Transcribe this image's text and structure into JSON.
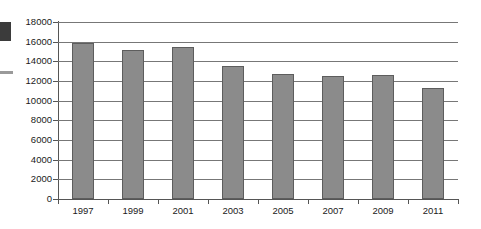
{
  "chart_data": {
    "type": "bar",
    "title": "",
    "subtitle": "",
    "xlabel": "",
    "ylabel": "",
    "categories": [
      "1997",
      "1999",
      "2001",
      "2003",
      "2005",
      "2007",
      "2009",
      "2011"
    ],
    "values": [
      15900,
      15200,
      15450,
      13500,
      12700,
      12500,
      12600,
      11300
    ],
    "series": [
      {
        "name": "",
        "values": [
          15900,
          15200,
          15450,
          13500,
          12700,
          12500,
          12600,
          11300
        ]
      }
    ],
    "ylim": [
      0,
      18000
    ],
    "ytick_values": [
      0,
      2000,
      4000,
      6000,
      8000,
      10000,
      12000,
      14000,
      16000,
      18000
    ],
    "ytick_labels": [
      "0",
      "2000",
      "4000",
      "6000",
      "8000",
      "10000",
      "12000",
      "14000",
      "16000",
      "18000"
    ],
    "xtick_labels": [
      "1997",
      "1999",
      "2001",
      "2003",
      "2005",
      "2007",
      "2009",
      "2011"
    ],
    "grid": true,
    "grid_axis": "y",
    "legend": false,
    "legend_position": "none",
    "annotations": [],
    "colors": {
      "bar_fill": "#8b8b8b",
      "bar_border": "#5d5d5d",
      "gridline": "#777777",
      "axis": "#555555",
      "text": "#1a1a1a",
      "background": "#ffffff"
    }
  },
  "artifacts": {
    "block_label": "scan-artifact-block",
    "dash_label": "scan-artifact-dash"
  }
}
